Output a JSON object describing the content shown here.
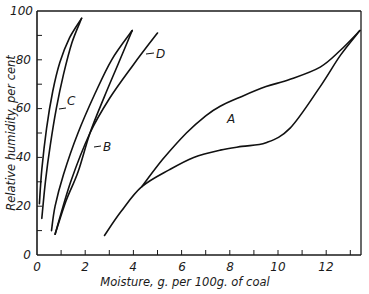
{
  "chart_data": {
    "type": "line",
    "title": "",
    "xlabel": "Moisture, g. per 100g. of coal",
    "ylabel": "Relative humidity, per cent",
    "xlim": [
      0,
      13.5
    ],
    "ylim": [
      0,
      100
    ],
    "x_ticks_major": [
      0,
      2,
      4,
      6,
      8,
      10,
      12
    ],
    "x_ticks_minor": [
      1,
      3,
      5,
      7,
      9,
      11,
      13
    ],
    "y_ticks_major": [
      0,
      20,
      40,
      60,
      80,
      100
    ],
    "y_ticks_minor": [
      10,
      30,
      50,
      70,
      90
    ],
    "x_tick_labels": [
      "0",
      "2",
      "4",
      "6",
      "8",
      "10",
      "12"
    ],
    "y_tick_labels": [
      "0",
      "20",
      "40",
      "60",
      "80",
      "100"
    ],
    "grid": false,
    "legend": "none (curves labeled directly with letters)",
    "series": [
      {
        "name": "A",
        "description": "hysteresis loop; adsorption (lower) and desorption (upper) branches",
        "branches": [
          {
            "name": "lower",
            "points": [
              [
                2.8,
                8
              ],
              [
                3.5,
                18
              ],
              [
                4.35,
                28
              ],
              [
                5.5,
                35
              ],
              [
                6.5,
                40
              ],
              [
                7.6,
                43
              ],
              [
                8.5,
                44.5
              ],
              [
                9.5,
                46
              ],
              [
                10.5,
                52
              ],
              [
                11.75,
                69
              ],
              [
                12.6,
                82
              ],
              [
                13.4,
                92
              ]
            ]
          },
          {
            "name": "upper",
            "points": [
              [
                4.35,
                28
              ],
              [
                5.2,
                39
              ],
              [
                6.2,
                50
              ],
              [
                7.0,
                57
              ],
              [
                7.6,
                61
              ],
              [
                8.5,
                65
              ],
              [
                9.5,
                69
              ],
              [
                10.5,
                72
              ],
              [
                11.75,
                77
              ],
              [
                12.6,
                84
              ],
              [
                13.4,
                92
              ]
            ]
          }
        ]
      },
      {
        "name": "B",
        "description": "hysteresis loop",
        "branches": [
          {
            "name": "lower",
            "points": [
              [
                0.75,
                8.5
              ],
              [
                1.2,
                22
              ],
              [
                1.7,
                34
              ],
              [
                2.2,
                50
              ],
              [
                2.8,
                65
              ],
              [
                3.4,
                79
              ],
              [
                3.95,
                92
              ]
            ]
          },
          {
            "name": "upper",
            "points": [
              [
                0.6,
                10
              ],
              [
                0.75,
                20
              ],
              [
                1.1,
                33
              ],
              [
                1.7,
                50
              ],
              [
                2.4,
                66
              ],
              [
                3.1,
                80
              ],
              [
                3.95,
                92
              ]
            ]
          }
        ]
      },
      {
        "name": "C",
        "description": "hysteresis loop",
        "branches": [
          {
            "name": "lower",
            "points": [
              [
                0.2,
                15
              ],
              [
                0.35,
                30
              ],
              [
                0.55,
                45
              ],
              [
                0.8,
                60
              ],
              [
                1.1,
                74
              ],
              [
                1.45,
                87
              ],
              [
                1.85,
                97
              ]
            ]
          },
          {
            "name": "upper",
            "points": [
              [
                0.1,
                21
              ],
              [
                0.2,
                35
              ],
              [
                0.4,
                52
              ],
              [
                0.65,
                67
              ],
              [
                0.95,
                79
              ],
              [
                1.35,
                89
              ],
              [
                1.85,
                97
              ]
            ]
          }
        ]
      },
      {
        "name": "D",
        "description": "single straight-ish line",
        "points": [
          [
            0.75,
            8.5
          ],
          [
            1.4,
            30
          ],
          [
            2.2,
            50
          ],
          [
            3.0,
            64
          ],
          [
            4.0,
            78
          ],
          [
            5.0,
            91
          ]
        ]
      }
    ],
    "annotations": [
      {
        "text": "A",
        "x": 8.0,
        "y": 56
      },
      {
        "text": "B",
        "x": 2.9,
        "y": 45,
        "arrow_to": [
          2.2,
          45
        ]
      },
      {
        "text": "C",
        "x": 1.25,
        "y": 63,
        "arrow_to": [
          0.8,
          60
        ]
      },
      {
        "text": "D",
        "x": 5.0,
        "y": 86,
        "arrow_to": [
          4.35,
          84
        ]
      }
    ]
  },
  "labels": {
    "xlabel": "Moisture, g. per 100g. of coal",
    "ylabel": "Relative humidity, per cent",
    "curve_a": "A",
    "curve_b": "B",
    "curve_c": "C",
    "curve_d": "D",
    "x0": "0",
    "x2": "2",
    "x4": "4",
    "x6": "6",
    "x8": "8",
    "x10": "10",
    "x12": "12",
    "y0": "0",
    "y20": "20",
    "y40": "40",
    "y60": "60",
    "y80": "80",
    "y100": "100"
  }
}
